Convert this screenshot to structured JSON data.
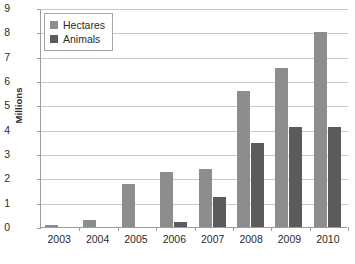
{
  "chart_data": {
    "type": "bar",
    "title": "",
    "xlabel": "",
    "ylabel": "Millions",
    "ylim": [
      0,
      9
    ],
    "ytick_step": 1,
    "grid": true,
    "legend_position": "top-left",
    "categories": [
      "2003",
      "2004",
      "2005",
      "2006",
      "2007",
      "2008",
      "2009",
      "2010"
    ],
    "series": [
      {
        "name": "Hectares",
        "color": "#8d8d8d",
        "values": [
          0.1,
          0.28,
          1.75,
          2.25,
          2.4,
          5.6,
          6.55,
          8.0
        ]
      },
      {
        "name": "Animals",
        "color": "#5b5b5b",
        "values": [
          0,
          0,
          0,
          0.2,
          1.25,
          3.45,
          4.1,
          4.1
        ]
      }
    ],
    "ytick_labels": [
      "0",
      "1",
      "2",
      "3",
      "4",
      "5",
      "6",
      "7",
      "8",
      "9"
    ]
  },
  "axis": {
    "y_title": "Millions"
  },
  "legend": {
    "items": [
      {
        "label": "Hectares",
        "swatch": "legend-swatch-hectares"
      },
      {
        "label": "Animals",
        "swatch": "legend-swatch-animals"
      }
    ]
  }
}
